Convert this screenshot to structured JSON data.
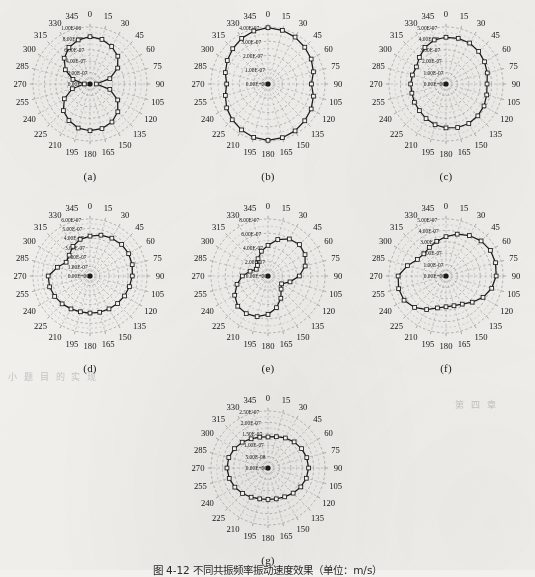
{
  "figure": {
    "caption": "图 4-12  不同共振频率振动速度效果（单位：m/s）",
    "panel_labels": [
      "(a)",
      "(b)",
      "(c)",
      "(d)",
      "(e)",
      "(f)",
      "(g)"
    ],
    "bleed_text_left": "小 题 目 的 实 现",
    "bleed_text_right": "第 四 章"
  },
  "style": {
    "grid_color": "#8a8a8a",
    "curve_color": "#1a1a1a",
    "marker_face": "#f4f3f0",
    "label_color": "#141414",
    "paper_color": "#f2f1ee"
  },
  "chart_data": [
    {
      "id": "a",
      "type": "line",
      "coordinate_system": "polar",
      "title": "(a)",
      "angle_unit": "degrees",
      "angle_ticks": [
        0,
        15,
        30,
        45,
        60,
        75,
        90,
        105,
        120,
        135,
        150,
        165,
        180,
        195,
        210,
        225,
        240,
        255,
        270,
        285,
        300,
        315,
        330,
        345
      ],
      "r_ticks": [
        0,
        2e-07,
        4e-07,
        6e-07,
        8e-07,
        1e-06
      ],
      "r_tick_labels": [
        "0.00E+00",
        "2.00E-07",
        "4.00E-07",
        "6.00E-07",
        "8.00E-07",
        "1.00E-06"
      ],
      "rlim": [
        0,
        1e-06
      ],
      "grid": true,
      "theta": [
        0,
        15,
        30,
        45,
        60,
        75,
        90,
        105,
        120,
        135,
        150,
        165,
        180,
        195,
        210,
        225,
        240,
        255,
        270,
        285,
        300,
        315,
        330,
        345
      ],
      "r": [
        8.3e-07,
        8.1e-07,
        7.6e-07,
        6.9e-07,
        5.6e-07,
        3.6e-07,
        1.1e-07,
        3.6e-07,
        5.6e-07,
        6.9e-07,
        7.7e-07,
        8.1e-07,
        8.2e-07,
        8e-07,
        7.4e-07,
        6.6e-07,
        5.2e-07,
        3.2e-07,
        1e-07,
        3.1e-07,
        5e-07,
        6.4e-07,
        7.4e-07,
        8e-07
      ]
    },
    {
      "id": "b",
      "type": "line",
      "coordinate_system": "polar",
      "title": "(b)",
      "angle_unit": "degrees",
      "angle_ticks": [
        0,
        15,
        30,
        45,
        60,
        75,
        90,
        105,
        120,
        135,
        150,
        165,
        180,
        195,
        210,
        225,
        240,
        255,
        270,
        285,
        300,
        315,
        330,
        345
      ],
      "r_ticks": [
        0,
        1e-07,
        2e-07,
        3e-07,
        4e-07
      ],
      "r_tick_labels": [
        "0.00E+00",
        "1.00E-07",
        "2.00E-07",
        "3.00E-07",
        "4.00E-07"
      ],
      "rlim": [
        0,
        4e-07
      ],
      "grid": true,
      "theta": [
        0,
        15,
        30,
        45,
        60,
        75,
        90,
        105,
        120,
        135,
        150,
        165,
        180,
        195,
        210,
        225,
        240,
        255,
        270,
        285,
        300,
        315,
        330,
        345
      ],
      "r": [
        3.95e-07,
        3.9e-07,
        3.8e-07,
        3.65e-07,
        3.5e-07,
        3.3e-07,
        3.05e-07,
        3.3e-07,
        3.5e-07,
        3.65e-07,
        3.8e-07,
        3.9e-07,
        3.95e-07,
        3.88e-07,
        3.72e-07,
        3.55e-07,
        3.35e-07,
        3.1e-07,
        2.9e-07,
        3.1e-07,
        3.3e-07,
        3.5e-07,
        3.7e-07,
        3.85e-07
      ]
    },
    {
      "id": "c",
      "type": "line",
      "coordinate_system": "polar",
      "title": "(c)",
      "angle_unit": "degrees",
      "angle_ticks": [
        0,
        15,
        30,
        45,
        60,
        75,
        90,
        105,
        120,
        135,
        150,
        165,
        180,
        195,
        210,
        225,
        240,
        255,
        270,
        285,
        300,
        315,
        330,
        345
      ],
      "r_ticks": [
        0,
        1e-07,
        2e-07,
        3e-07,
        4e-07,
        5e-07
      ],
      "r_tick_labels": [
        "0.00E+00",
        "1.00E-07",
        "2.00E-07",
        "3.00E-07",
        "4.00E-07",
        "5.00E-07"
      ],
      "rlim": [
        0,
        5e-07
      ],
      "grid": true,
      "theta": [
        0,
        15,
        30,
        45,
        60,
        75,
        90,
        105,
        120,
        135,
        150,
        165,
        180,
        195,
        210,
        225,
        240,
        255,
        270,
        285,
        300,
        315,
        330,
        345
      ],
      "r": [
        4.1e-07,
        4.15e-07,
        4.15e-07,
        4.05e-07,
        3.9e-07,
        3.75e-07,
        3.6e-07,
        3.7e-07,
        3.85e-07,
        3.95e-07,
        4e-07,
        3.95e-07,
        3.85e-07,
        3.7e-07,
        3.5e-07,
        3.3e-07,
        3.2e-07,
        3.1e-07,
        3.1e-07,
        3.05e-07,
        3e-07,
        3.3e-07,
        3.7e-07,
        4e-07
      ]
    },
    {
      "id": "d",
      "type": "line",
      "coordinate_system": "polar",
      "title": "(d)",
      "angle_unit": "degrees",
      "angle_ticks": [
        0,
        15,
        30,
        45,
        60,
        75,
        90,
        105,
        120,
        135,
        150,
        165,
        180,
        195,
        210,
        225,
        240,
        255,
        270,
        285,
        300,
        315,
        330,
        345
      ],
      "r_ticks": [
        0,
        1e-07,
        2e-07,
        3e-07,
        4e-07,
        5e-07,
        6e-07
      ],
      "r_tick_labels": [
        "0.00E+00",
        "1.00E-07",
        "2.00E-07",
        "3.00E-07",
        "4.00E-07",
        "5.00E-07",
        "6.00E-07"
      ],
      "rlim": [
        0,
        6e-07
      ],
      "grid": true,
      "theta": [
        0,
        15,
        30,
        45,
        60,
        75,
        90,
        105,
        120,
        135,
        150,
        165,
        180,
        195,
        210,
        225,
        240,
        255,
        270,
        285,
        300,
        315,
        330,
        345
      ],
      "r": [
        4.2e-07,
        4.45e-07,
        4.6e-07,
        4.7e-07,
        4.7e-07,
        4.6e-07,
        4.45e-07,
        4.3e-07,
        4.2e-07,
        4.1e-07,
        4e-07,
        3.95e-07,
        3.9e-07,
        3.9e-07,
        4e-07,
        4.15e-07,
        4.3e-07,
        4.4e-07,
        4.4e-07,
        3.55e-07,
        2.9e-07,
        3.1e-07,
        3.6e-07,
        4e-07
      ]
    },
    {
      "id": "e",
      "type": "line",
      "coordinate_system": "polar",
      "title": "(e)",
      "angle_unit": "degrees",
      "angle_ticks": [
        0,
        15,
        30,
        45,
        60,
        75,
        90,
        105,
        120,
        135,
        150,
        165,
        180,
        195,
        210,
        225,
        240,
        255,
        270,
        285,
        300,
        315,
        330,
        345
      ],
      "r_ticks": [
        0,
        2e-07,
        4e-07,
        6e-07,
        8e-07
      ],
      "r_tick_labels": [
        "0.00E+00",
        "2.00E-07",
        "4.00E-07",
        "6.00E-07",
        "8.00E-07"
      ],
      "rlim": [
        0,
        8e-07
      ],
      "grid": true,
      "theta": [
        0,
        15,
        30,
        45,
        60,
        75,
        90,
        105,
        120,
        135,
        150,
        165,
        180,
        195,
        210,
        225,
        240,
        255,
        270,
        285,
        300,
        315,
        330,
        345
      ],
      "r": [
        4.3e-07,
        5.3e-07,
        6e-07,
        6.25e-07,
        6e-07,
        5.4e-07,
        4.4e-07,
        3.2e-07,
        2.2e-07,
        2.6e-07,
        3.6e-07,
        4.6e-07,
        5.4e-07,
        5.9e-07,
        6.1e-07,
        6e-07,
        5.4e-07,
        4.5e-07,
        3.6e-07,
        2.6e-07,
        1.9e-07,
        2.1e-07,
        2.8e-07,
        3.6e-07
      ]
    },
    {
      "id": "f",
      "type": "line",
      "coordinate_system": "polar",
      "title": "(f)",
      "angle_unit": "degrees",
      "angle_ticks": [
        0,
        15,
        30,
        45,
        60,
        75,
        90,
        105,
        120,
        135,
        150,
        165,
        180,
        195,
        210,
        225,
        240,
        255,
        270,
        285,
        300,
        315,
        330,
        345
      ],
      "r_ticks": [
        0,
        1e-07,
        2e-07,
        3e-07,
        4e-07,
        5e-07
      ],
      "r_tick_labels": [
        "0.00E+00",
        "1.00E-07",
        "2.00E-07",
        "3.00E-07",
        "4.00E-07",
        "5.00E-07"
      ],
      "rlim": [
        0,
        5e-07
      ],
      "grid": true,
      "theta": [
        0,
        15,
        30,
        45,
        60,
        75,
        90,
        105,
        120,
        135,
        150,
        165,
        180,
        195,
        210,
        225,
        240,
        255,
        270,
        285,
        300,
        315,
        330,
        345
      ],
      "r": [
        3.45e-07,
        3.8e-07,
        4.1e-07,
        4.35e-07,
        4.5e-07,
        4.5e-07,
        4.4e-07,
        4.15e-07,
        3.75e-07,
        3.25e-07,
        2.85e-07,
        2.7e-07,
        2.7e-07,
        2.9e-07,
        3.4e-07,
        3.9e-07,
        4.25e-07,
        4.3e-07,
        4.2e-07,
        3.5e-07,
        2.9e-07,
        2.75e-07,
        2.9e-07,
        3.15e-07
      ]
    },
    {
      "id": "g",
      "type": "line",
      "coordinate_system": "polar",
      "title": "(g)",
      "angle_unit": "degrees",
      "angle_ticks": [
        0,
        15,
        30,
        45,
        60,
        75,
        90,
        105,
        120,
        135,
        150,
        165,
        180,
        195,
        210,
        225,
        240,
        255,
        270,
        285,
        300,
        315,
        330,
        345
      ],
      "r_ticks": [
        0,
        5e-08,
        1e-07,
        1.5e-07,
        2e-07,
        2.5e-07
      ],
      "r_tick_labels": [
        "0.00E+00",
        "5.00E-08",
        "1.00E-07",
        "1.50E-07",
        "2.00E-07",
        "2.50E-07"
      ],
      "rlim": [
        0,
        2.5e-07
      ],
      "grid": true,
      "theta": [
        0,
        15,
        30,
        45,
        60,
        75,
        90,
        105,
        120,
        135,
        150,
        165,
        180,
        195,
        210,
        225,
        240,
        255,
        270,
        285,
        300,
        315,
        330,
        345
      ],
      "r": [
        1.36e-07,
        1.42e-07,
        1.52e-07,
        1.62e-07,
        1.7e-07,
        1.76e-07,
        1.78e-07,
        1.74e-07,
        1.66e-07,
        1.56e-07,
        1.46e-07,
        1.4e-07,
        1.38e-07,
        1.4e-07,
        1.48e-07,
        1.58e-07,
        1.68e-07,
        1.76e-07,
        1.8e-07,
        1.78e-07,
        1.7e-07,
        1.6e-07,
        1.48e-07,
        1.4e-07
      ]
    }
  ]
}
